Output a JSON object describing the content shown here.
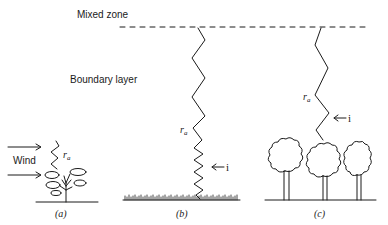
{
  "labels": {
    "mixed_zone": "Mixed zone",
    "boundary_layer": "Boundary layer",
    "wind": "Wind",
    "resistance_symbol": "r",
    "resistance_subscript": "a",
    "interface_marker": "← i"
  },
  "panels": [
    {
      "id": "a",
      "caption": "(a)",
      "subject": "single plant"
    },
    {
      "id": "b",
      "caption": "(b)",
      "subject": "short grass canopy"
    },
    {
      "id": "c",
      "caption": "(c)",
      "subject": "tree canopy"
    }
  ],
  "colors": {
    "ink": "#1a1a1a",
    "background": "#ffffff"
  }
}
